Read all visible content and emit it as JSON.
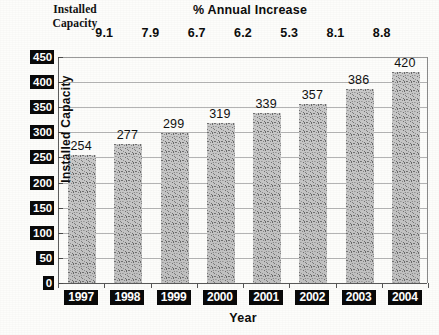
{
  "header": {
    "installed_capacity_label": "Installed\nCapacity",
    "installed_capacity_line1": "Installed",
    "installed_capacity_line2": "Capacity",
    "annual_increase_title": "% Annual Increase"
  },
  "axes": {
    "y_title": "Installed Capacity",
    "x_title": "Year"
  },
  "chart_data": {
    "type": "bar",
    "title": "% Annual Increase",
    "xlabel": "Year",
    "ylabel": "Installed Capacity",
    "ylim": [
      0,
      450
    ],
    "yticks": [
      0,
      50,
      100,
      150,
      200,
      250,
      300,
      350,
      400,
      450
    ],
    "ytick_labels": [
      "0",
      "50",
      "100",
      "150",
      "200",
      "250",
      "300",
      "350",
      "400",
      "450"
    ],
    "grid": true,
    "legend": "none",
    "categories": [
      "1997",
      "1998",
      "1999",
      "2000",
      "2001",
      "2002",
      "2003",
      "2004"
    ],
    "values": [
      254,
      277,
      299,
      319,
      339,
      357,
      386,
      420
    ],
    "value_labels": [
      "254",
      "277",
      "299",
      "319",
      "339",
      "357",
      "386",
      "420"
    ],
    "annotations": {
      "label": "% Annual Increase",
      "values": [
        9.1,
        7.9,
        6.7,
        6.2,
        5.3,
        8.1,
        8.8
      ],
      "text": [
        "9.1",
        "7.9",
        "6.7",
        "6.2",
        "5.3",
        "8.1",
        "8.8"
      ]
    },
    "colors": {
      "bar_fill": "#bdbdbd",
      "axis": "#4a4a4a",
      "grid": "#b4b4b4",
      "label_bg": "#0a0a0a",
      "label_fg": "#ffffff",
      "text": "#111111",
      "background": "#fdfdfb"
    }
  }
}
